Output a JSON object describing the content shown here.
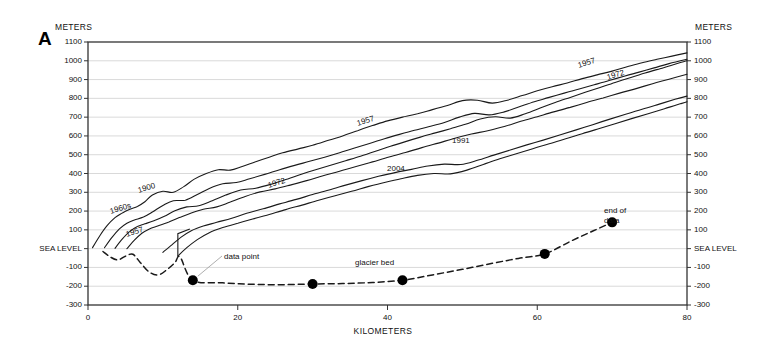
{
  "figure": {
    "panel_letter": "A",
    "left_axis_unit": "METERS",
    "right_axis_unit": "METERS",
    "x_axis_title": "KILOMETERS"
  },
  "axes": {
    "y_ticks": [
      "1100",
      "1000",
      "900",
      "800",
      "700",
      "600",
      "500",
      "400",
      "300",
      "200",
      "100",
      "SEA LEVEL",
      "-100",
      "-200",
      "-300"
    ],
    "y_values": [
      1100,
      1000,
      900,
      800,
      700,
      600,
      500,
      400,
      300,
      200,
      100,
      0,
      -100,
      -200,
      -300
    ],
    "x_ticks": [
      "0",
      "20",
      "40",
      "60",
      "80"
    ],
    "x_values": [
      0,
      20,
      40,
      60,
      80
    ]
  },
  "annotations": [
    {
      "name": "data-point-annotation",
      "text": "data point",
      "x": 224,
      "y": 252
    },
    {
      "name": "glacier-bed-annotation",
      "text": "glacier bed",
      "x": 355,
      "y": 258
    },
    {
      "name": "end-of-data-annotation",
      "text": "end of\ndata",
      "x": 604,
      "y": 206
    }
  ],
  "curve_labels": [
    {
      "name": "curve-label-1900",
      "text": "1900",
      "x": 138,
      "y": 186,
      "rot": -17
    },
    {
      "name": "curve-label-1960s",
      "text": "1960s",
      "x": 110,
      "y": 207,
      "rot": -17
    },
    {
      "name": "curve-label-1957-left",
      "text": "1957",
      "x": 126,
      "y": 230,
      "rot": -17
    },
    {
      "name": "curve-label-1972-left",
      "text": "1972",
      "x": 268,
      "y": 181,
      "rot": -17
    },
    {
      "name": "curve-label-1957-mid",
      "text": "1957",
      "x": 357,
      "y": 119,
      "rot": -17
    },
    {
      "name": "curve-label-2004",
      "text": "2004",
      "x": 387,
      "y": 164,
      "rot": 0
    },
    {
      "name": "curve-label-1991",
      "text": "1991",
      "x": 452,
      "y": 136,
      "rot": 0
    },
    {
      "name": "curve-label-1957-right",
      "text": "1957",
      "x": 578,
      "y": 61,
      "rot": -17
    },
    {
      "name": "curve-label-1972-right",
      "text": "1972",
      "x": 607,
      "y": 73,
      "rot": -17
    }
  ],
  "chart_data": {
    "type": "line",
    "title": "",
    "xlabel": "KILOMETERS",
    "ylabel": "METERS",
    "xlim": [
      0,
      80
    ],
    "ylim": [
      -300,
      1100
    ],
    "grid": true,
    "legend": "inline-curve-labels",
    "series": [
      {
        "name": "1900",
        "style": "solid",
        "x": [
          0.6,
          1.6,
          2.6,
          3.6,
          4.6,
          5.6,
          6.6,
          7.6,
          8.6,
          10.0,
          11.4,
          12.8,
          14.2,
          15.8,
          17.4,
          19.0,
          20.6,
          22.4,
          24.2,
          26.0,
          28.0,
          30.0,
          32.0,
          34.0,
          36.0,
          38.0,
          40.0,
          42.0,
          44.0,
          46.0,
          48.0,
          50.0,
          52.0,
          54.0,
          56.0,
          58.0,
          60.0,
          62.0,
          64.0,
          66.0,
          68.0,
          70.0,
          72.0,
          74.0,
          76.0,
          78.0,
          80.0
        ],
        "y": [
          5,
          70,
          125,
          165,
          190,
          210,
          225,
          250,
          285,
          305,
          300,
          330,
          370,
          400,
          420,
          418,
          438,
          463,
          487,
          510,
          530,
          550,
          575,
          600,
          628,
          655,
          680,
          700,
          718,
          740,
          762,
          788,
          790,
          775,
          790,
          815,
          840,
          862,
          882,
          905,
          925,
          945,
          968,
          990,
          1008,
          1025,
          1042
        ]
      },
      {
        "name": "1960s",
        "style": "solid",
        "x": [
          2.2,
          3.2,
          4.2,
          5.2,
          6.2,
          7.4,
          8.6,
          10.0,
          11.4,
          13.0,
          14.6,
          16.2,
          18.0,
          19.8,
          21.6,
          23.6,
          25.6,
          27.6,
          29.6,
          31.6,
          33.6,
          35.6,
          37.6,
          39.6,
          41.6,
          43.6,
          45.6,
          47.6,
          49.6,
          51.6,
          53.6,
          55.6,
          57.6,
          59.6,
          61.6,
          63.6,
          65.6,
          67.6,
          69.6,
          71.6,
          73.6,
          75.6,
          77.6,
          80.0
        ],
        "y": [
          5,
          60,
          105,
          135,
          152,
          168,
          195,
          230,
          255,
          258,
          288,
          320,
          345,
          352,
          372,
          395,
          420,
          443,
          465,
          487,
          510,
          535,
          560,
          585,
          608,
          630,
          650,
          672,
          700,
          720,
          712,
          728,
          755,
          782,
          805,
          828,
          850,
          872,
          895,
          918,
          940,
          962,
          985,
          1008
        ]
      },
      {
        "name": "1957",
        "style": "solid",
        "x": [
          3.6,
          4.6,
          5.6,
          6.6,
          7.6,
          8.8,
          10.2,
          11.6,
          13.2,
          14.8,
          16.6,
          18.4,
          20.4,
          22.4,
          24.4,
          26.4,
          28.4,
          30.4,
          32.4,
          34.4,
          36.4,
          38.4,
          40.4,
          42.4,
          44.4,
          46.4,
          48.4,
          50.4,
          52.4,
          54.4,
          56.4,
          58.4,
          60.4,
          62.4,
          64.4,
          66.4,
          68.4,
          70.4,
          72.4,
          74.4,
          76.4,
          78.4,
          80.0
        ],
        "y": [
          2,
          52,
          92,
          118,
          132,
          148,
          172,
          202,
          222,
          228,
          255,
          285,
          312,
          322,
          342,
          368,
          395,
          420,
          444,
          468,
          492,
          518,
          545,
          570,
          594,
          616,
          638,
          662,
          690,
          702,
          695,
          718,
          748,
          778,
          805,
          832,
          858,
          885,
          910,
          935,
          958,
          982,
          1000
        ]
      },
      {
        "name": "1972",
        "style": "solid",
        "x": [
          5.2,
          6.2,
          7.2,
          8.2,
          9.4,
          10.8,
          12.2,
          13.8,
          15.4,
          17.2,
          19.0,
          21.0,
          23.0,
          25.0,
          27.0,
          29.2,
          31.4,
          33.6,
          35.8,
          38.0,
          40.2,
          42.4,
          44.6,
          46.8,
          49.0,
          51.2,
          53.4,
          55.6,
          57.8,
          60.0,
          62.2,
          64.4,
          66.6,
          68.8,
          71.0,
          73.2,
          75.4,
          77.6,
          80.0
        ],
        "y": [
          0,
          45,
          82,
          105,
          122,
          142,
          165,
          190,
          210,
          222,
          248,
          278,
          302,
          318,
          338,
          362,
          388,
          412,
          437,
          462,
          488,
          512,
          538,
          562,
          588,
          610,
          628,
          650,
          678,
          702,
          728,
          752,
          778,
          802,
          828,
          852,
          878,
          902,
          928
        ]
      },
      {
        "name": "1991",
        "style": "solid",
        "x": [
          10.0,
          11.2,
          12.4,
          13.8,
          15.4,
          17.2,
          19.2,
          21.2,
          23.4,
          25.6,
          27.8,
          30.0,
          32.2,
          34.4,
          36.6,
          38.8,
          41.0,
          43.2,
          45.4,
          47.6,
          49.8,
          52.0,
          54.2,
          56.4,
          58.6,
          60.8,
          63.0,
          65.2,
          67.4,
          69.6,
          71.8,
          74.0,
          76.2,
          78.4,
          80.0
        ],
        "y": [
          -20,
          20,
          60,
          95,
          120,
          140,
          162,
          188,
          212,
          238,
          262,
          288,
          312,
          338,
          362,
          385,
          405,
          422,
          440,
          450,
          448,
          470,
          498,
          525,
          552,
          578,
          605,
          632,
          660,
          688,
          715,
          742,
          768,
          795,
          812
        ]
      },
      {
        "name": "2004",
        "style": "solid",
        "x": [
          12.0,
          13.2,
          14.6,
          16.2,
          18.0,
          20.0,
          22.0,
          24.2,
          26.4,
          28.6,
          30.8,
          33.0,
          35.2,
          37.4,
          39.6,
          41.8,
          44.0,
          46.2,
          48.4,
          50.6,
          52.8,
          55.0,
          57.2,
          59.4,
          61.6,
          63.8,
          66.0,
          68.2,
          70.4,
          72.6,
          74.8,
          77.0,
          79.2,
          80.0
        ],
        "y": [
          -40,
          5,
          48,
          85,
          112,
          135,
          158,
          182,
          208,
          232,
          258,
          282,
          305,
          330,
          352,
          372,
          390,
          400,
          398,
          418,
          448,
          478,
          505,
          532,
          558,
          585,
          612,
          638,
          665,
          692,
          718,
          745,
          772,
          782
        ]
      },
      {
        "name": "glacier bed",
        "style": "dashed",
        "marker": "filled-circle",
        "x": [
          2.0,
          3.0,
          4.0,
          5.0,
          6.0,
          7.0,
          8.2,
          9.4,
          10.6,
          11.6,
          12.3,
          14.0,
          18.0,
          22.0,
          26.0,
          30.0,
          34.0,
          38.0,
          42.0,
          46.0,
          50.0,
          54.0,
          57.5,
          61.0,
          64.5,
          67.5,
          70.0
        ],
        "y": [
          -15,
          -45,
          -60,
          -40,
          -30,
          -75,
          -125,
          -140,
          -110,
          -75,
          -45,
          -168,
          -182,
          -190,
          -192,
          -188,
          -186,
          -180,
          -168,
          -140,
          -110,
          -78,
          -52,
          -28,
          40,
          95,
          140
        ]
      }
    ],
    "data_points": [
      {
        "x": 14.0,
        "y": -168
      },
      {
        "x": 30.0,
        "y": -188
      },
      {
        "x": 42.0,
        "y": -168
      },
      {
        "x": 61.0,
        "y": -28
      },
      {
        "x": 70.0,
        "y": 140
      }
    ]
  }
}
